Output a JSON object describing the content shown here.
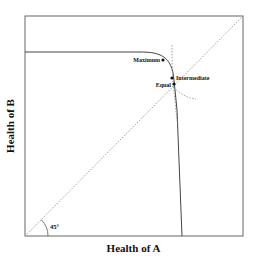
{
  "diagram": {
    "xlabel": "Health of A",
    "ylabel": "Health of B",
    "angle_label": "45°",
    "points": [
      {
        "id": "maximum",
        "label": "Maximum"
      },
      {
        "id": "intermediate",
        "label": "Intermediate"
      },
      {
        "id": "equal",
        "label": "Equal"
      }
    ],
    "colors": {
      "frame": "#555555",
      "curve": "#444444",
      "dotted": "#777777",
      "text": "#111111"
    }
  }
}
